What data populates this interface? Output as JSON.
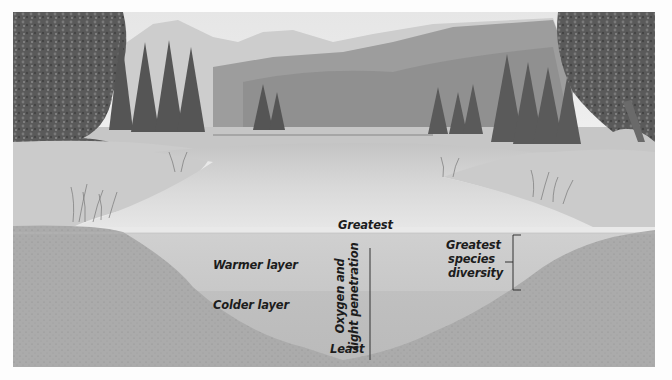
{
  "figure": {
    "colors": {
      "sky": "#ececec",
      "mountain": "#c9c9c9",
      "forest_dark": "#5e5e5e",
      "grass": "#cfcfcf",
      "water_surface": "#d6d6d6",
      "warmer_layer": "#cbcbcb",
      "colder_layer": "#bdbdbd",
      "sediment": "#a9a9a9",
      "text": "#1c1c1c"
    }
  },
  "labels": {
    "greatest_top": "Greatest",
    "least_bottom": "Least",
    "gradient_line1": "Oxygen and",
    "gradient_line2": "light penetration",
    "warmer_layer": "Warmer layer",
    "colder_layer": "Colder layer",
    "diversity_line1": "Greatest",
    "diversity_line2": "species",
    "diversity_line3": "diversity"
  }
}
